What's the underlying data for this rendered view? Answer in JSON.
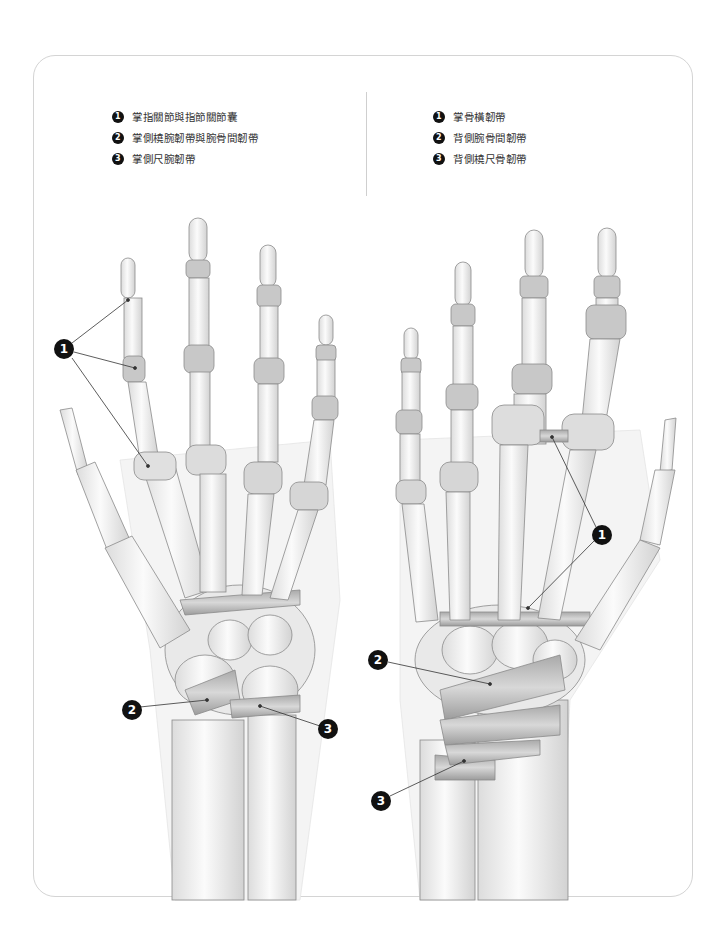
{
  "figure": {
    "left_panel": {
      "view": "palmar",
      "legend": [
        {
          "num": "1",
          "label": "掌指關節與指節關節囊"
        },
        {
          "num": "2",
          "label": "掌側橈腕韌帶與腕骨間韌帶"
        },
        {
          "num": "3",
          "label": "掌側尺腕韌帶"
        }
      ],
      "callouts": [
        {
          "num": "1",
          "x": 64,
          "y": 349
        },
        {
          "num": "2",
          "x": 132,
          "y": 710
        },
        {
          "num": "3",
          "x": 328,
          "y": 729
        }
      ]
    },
    "right_panel": {
      "view": "dorsal",
      "legend": [
        {
          "num": "1",
          "label": "掌骨橫韌帶"
        },
        {
          "num": "2",
          "label": "背側腕骨間韌帶"
        },
        {
          "num": "3",
          "label": "背側橈尺骨韌帶"
        }
      ],
      "callouts": [
        {
          "num": "1",
          "x": 602,
          "y": 535
        },
        {
          "num": "2",
          "x": 378,
          "y": 660
        },
        {
          "num": "3",
          "x": 381,
          "y": 801
        }
      ]
    },
    "colors": {
      "bone": "#f7f7f7",
      "bone_outline": "#8a8a8a",
      "ligament": "#c9c9c9",
      "callout": "#111111",
      "frame": "#d4d4d4"
    }
  }
}
